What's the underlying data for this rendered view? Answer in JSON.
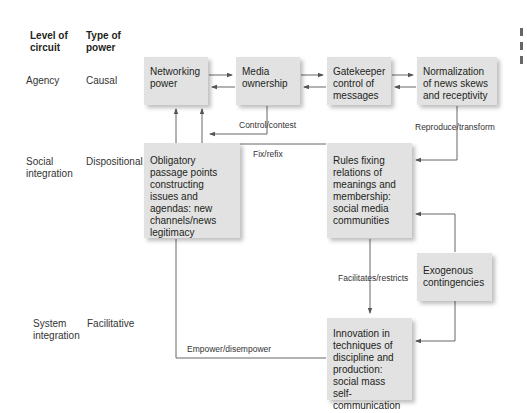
{
  "headers": {
    "level_of_circuit": "Level of circuit",
    "type_of_power": "Type of power"
  },
  "rows": [
    {
      "level": "Agency",
      "power_type": "Causal"
    },
    {
      "level": "Social integration",
      "power_type": "Dispositional"
    },
    {
      "level": "System integration",
      "power_type": "Facilitative"
    }
  ],
  "nodes": {
    "networking_power": "Networking power",
    "media_ownership": "Media ownership",
    "gatekeeper": "Gatekeeper control of messages",
    "normalization": "Normalization of news skews and receptivity",
    "obligatory_passage": "Obligatory passage points constructing issues and agendas: new channels/news legitimacy",
    "rules_fixing": "Rules fixing relations of meanings and membership: social media communities",
    "exogenous": "Exogenous contingencies",
    "innovation": "Innovation in techniques of discipline and production: social mass self-communication"
  },
  "edge_labels": {
    "control_contest": "Control/contest",
    "fix_refix": "Fix/refix",
    "reproduce_transform": "Reproduce/transform",
    "facilitates_restricts": "Facilitates/restricts",
    "empower_disempower": "Empower/disempower"
  },
  "colors": {
    "box_fill": "#e2e2e2",
    "line": "#555555",
    "text": "#231f20"
  }
}
